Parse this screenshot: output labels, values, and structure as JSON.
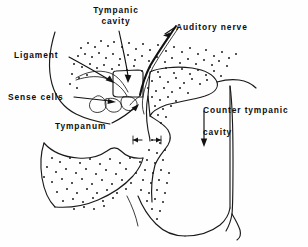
{
  "figure": {
    "kind": "anatomical-line-diagram",
    "background_color": "#fefefe",
    "ink_color": "#111111",
    "width": 308,
    "height": 247
  },
  "labels": {
    "tympanic_cavity": {
      "line1": "Tympanic",
      "line2": "cavity",
      "full": "Tympanic cavity"
    },
    "auditory_nerve": {
      "text": "Auditory nerve"
    },
    "ligament": {
      "text": "Ligament"
    },
    "sense_cells": {
      "text": "Sense cells"
    },
    "tympanum": {
      "text": "Tympanum"
    },
    "counter_tympanic_cavity": {
      "line1": "Counter tympanic",
      "line2": "cavity",
      "full": "Counter tympanic cavity"
    }
  },
  "leaders": [
    {
      "name": "tympanic-cavity-leader",
      "from_label": "tympanic_cavity",
      "arrow_direction": "down"
    },
    {
      "name": "auditory-nerve-leader",
      "from_label": "auditory_nerve",
      "arrow_direction": "left"
    },
    {
      "name": "ligament-leader",
      "from_label": "ligament",
      "arrow_direction": "down-right"
    },
    {
      "name": "sense-cells-leader",
      "from_label": "sense_cells",
      "arrow_direction": "right"
    },
    {
      "name": "tympanum-leader",
      "from_label": "tympanum",
      "arrow_direction": "up-right"
    },
    {
      "name": "counter-tympanic-cavity-leader",
      "from_label": "counter_tympanic_cavity",
      "arrow_direction": "down"
    }
  ]
}
